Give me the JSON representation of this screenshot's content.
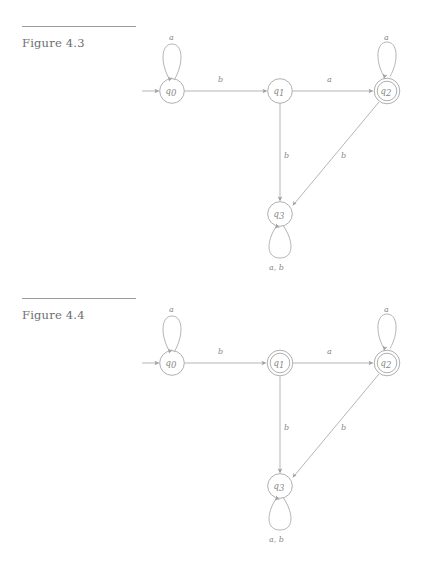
{
  "page": {
    "background_color": "#ffffff",
    "ink_color": "#a6a6a6",
    "text_color": "#6e6e6e",
    "width": 444,
    "height": 572
  },
  "figures": [
    {
      "id": "figure-4-3",
      "caption": "Figure 4.3",
      "diagram": {
        "type": "finite-state-automaton",
        "alphabet": [
          "a",
          "b"
        ],
        "start_state": "q0",
        "states": [
          {
            "name": "q0",
            "base": "q",
            "subscript": "0",
            "accepting": false,
            "x": 172,
            "y": 91
          },
          {
            "name": "q1",
            "base": "q",
            "subscript": "1",
            "accepting": false,
            "x": 280,
            "y": 91
          },
          {
            "name": "q2",
            "base": "q",
            "subscript": "2",
            "accepting": true,
            "x": 387,
            "y": 91
          },
          {
            "name": "q3",
            "base": "q",
            "subscript": "3",
            "accepting": false,
            "x": 280,
            "y": 214
          }
        ],
        "transitions": [
          {
            "from": "q0",
            "to": "q0",
            "label": "a",
            "kind": "self-loop",
            "label_x": 172,
            "label_y": 42
          },
          {
            "from": "q0",
            "to": "q1",
            "label": "b",
            "kind": "straight",
            "label_x": 221,
            "label_y": 82
          },
          {
            "from": "q1",
            "to": "q2",
            "label": "a",
            "kind": "straight",
            "label_x": 330,
            "label_y": 82
          },
          {
            "from": "q2",
            "to": "q2",
            "label": "a",
            "kind": "self-loop",
            "label_x": 387,
            "label_y": 42
          },
          {
            "from": "q1",
            "to": "q3",
            "label": "b",
            "kind": "straight",
            "label_x": 287,
            "label_y": 157
          },
          {
            "from": "q2",
            "to": "q3",
            "label": "b",
            "kind": "diagonal",
            "label_x": 345,
            "label_y": 157
          },
          {
            "from": "q3",
            "to": "q3",
            "label": "a, b",
            "kind": "self-loop",
            "label_x": 280,
            "label_y": 268
          }
        ]
      }
    },
    {
      "id": "figure-4-4",
      "caption": "Figure 4.4",
      "diagram": {
        "type": "finite-state-automaton",
        "alphabet": [
          "a",
          "b"
        ],
        "start_state": "q0",
        "states": [
          {
            "name": "q0",
            "base": "q",
            "subscript": "0",
            "accepting": false,
            "x": 172,
            "y": 91
          },
          {
            "name": "q1",
            "base": "q",
            "subscript": "1",
            "accepting": true,
            "x": 280,
            "y": 91
          },
          {
            "name": "q2",
            "base": "q",
            "subscript": "2",
            "accepting": true,
            "x": 387,
            "y": 91
          },
          {
            "name": "q3",
            "base": "q",
            "subscript": "3",
            "accepting": false,
            "x": 280,
            "y": 214
          }
        ],
        "transitions": [
          {
            "from": "q0",
            "to": "q0",
            "label": "a",
            "kind": "self-loop",
            "label_x": 172,
            "label_y": 42
          },
          {
            "from": "q0",
            "to": "q1",
            "label": "b",
            "kind": "straight",
            "label_x": 221,
            "label_y": 82
          },
          {
            "from": "q1",
            "to": "q2",
            "label": "a",
            "kind": "straight",
            "label_x": 330,
            "label_y": 82
          },
          {
            "from": "q2",
            "to": "q2",
            "label": "a",
            "kind": "self-loop",
            "label_x": 387,
            "label_y": 42
          },
          {
            "from": "q1",
            "to": "q3",
            "label": "b",
            "kind": "straight",
            "label_x": 287,
            "label_y": 157
          },
          {
            "from": "q2",
            "to": "q3",
            "label": "b",
            "kind": "diagonal",
            "label_x": 345,
            "label_y": 157
          },
          {
            "from": "q3",
            "to": "q3",
            "label": "a, b",
            "kind": "self-loop",
            "label_x": 280,
            "label_y": 268
          }
        ]
      }
    }
  ]
}
